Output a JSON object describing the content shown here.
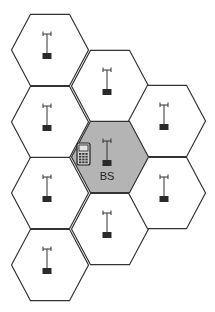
{
  "diagram": {
    "type": "cellular-network-hexagonal-cells",
    "colors": {
      "cell_fill": "#ffffff",
      "serving_cell_fill": "#b4b4b4",
      "cell_stroke": "#333333",
      "base_station": "#2a2a2a",
      "phone_body": "#d0d0d0"
    },
    "cells": [
      {
        "id": "cell-1",
        "cx": 50,
        "cy": 50,
        "serving": false,
        "has_base_station": true
      },
      {
        "id": "cell-2",
        "cx": 50,
        "cy": 122,
        "serving": false,
        "has_base_station": true
      },
      {
        "id": "cell-3",
        "cx": 50,
        "cy": 193,
        "serving": false,
        "has_base_station": true
      },
      {
        "id": "cell-4",
        "cx": 50,
        "cy": 265,
        "serving": false,
        "has_base_station": true
      },
      {
        "id": "cell-5",
        "cx": 110,
        "cy": 86,
        "serving": false,
        "has_base_station": true
      },
      {
        "id": "cell-6",
        "cx": 110,
        "cy": 157,
        "serving": true,
        "has_base_station": true
      },
      {
        "id": "cell-7",
        "cx": 110,
        "cy": 229,
        "serving": false,
        "has_base_station": true
      },
      {
        "id": "cell-8",
        "cx": 167,
        "cy": 121,
        "serving": false,
        "has_base_station": true
      },
      {
        "id": "cell-9",
        "cx": 167,
        "cy": 193,
        "serving": false,
        "has_base_station": true
      }
    ],
    "serving_cell": {
      "base_station_label": "BS",
      "mobile_device_icon": "mobile-phone-icon"
    },
    "icons": {
      "base_station": "antenna-tower-icon",
      "mobile": "mobile-phone-icon"
    }
  }
}
